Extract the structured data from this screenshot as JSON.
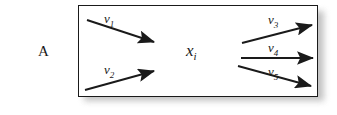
{
  "figure": {
    "outer_label": "A",
    "node_label": {
      "base": "x",
      "sub": "i"
    },
    "box": {
      "fill_color": "#ffffff",
      "border_color": "#1a1a1a",
      "shadow_color": "#b9b9b9"
    },
    "inflows": [
      {
        "id": "v1",
        "base": "v",
        "sub": "1",
        "direction": "down-right"
      },
      {
        "id": "v2",
        "base": "v",
        "sub": "2",
        "direction": "up-right"
      }
    ],
    "outflows": [
      {
        "id": "v3",
        "base": "v",
        "sub": "3",
        "direction": "up-right"
      },
      {
        "id": "v4",
        "base": "v",
        "sub": "4",
        "direction": "right"
      },
      {
        "id": "v5",
        "base": "v",
        "sub": "5",
        "direction": "down-right"
      }
    ],
    "arrow_color": "#1a1a1a"
  }
}
